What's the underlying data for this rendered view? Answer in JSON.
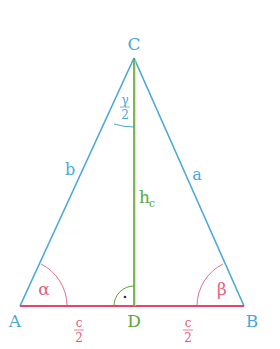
{
  "diagram": {
    "colors": {
      "sides": "#4aa8d8",
      "base": "#e8446a",
      "altitude": "#5aa83a",
      "altitude_highlight": "#e8e040",
      "angle_arc_alpha_beta": "#e06080",
      "angle_arc_gamma": "#4aa8d8",
      "right_angle": "#5aa83a"
    },
    "vertices": {
      "A": {
        "label": "A",
        "x": 20,
        "y": 306
      },
      "B": {
        "label": "B",
        "x": 244,
        "y": 306
      },
      "C": {
        "label": "C",
        "x": 134,
        "y": 58
      },
      "D": {
        "label": "D",
        "x": 134,
        "y": 306
      }
    },
    "side_labels": {
      "a": "a",
      "b": "b",
      "h": "h",
      "h_sub": "c"
    },
    "angle_labels": {
      "alpha": "α",
      "beta": "β",
      "gamma_num": "γ",
      "gamma_den": "2"
    },
    "segment_labels": {
      "left_num": "c",
      "left_den": "2",
      "right_num": "c",
      "right_den": "2"
    },
    "right_angle_mark": "·"
  }
}
